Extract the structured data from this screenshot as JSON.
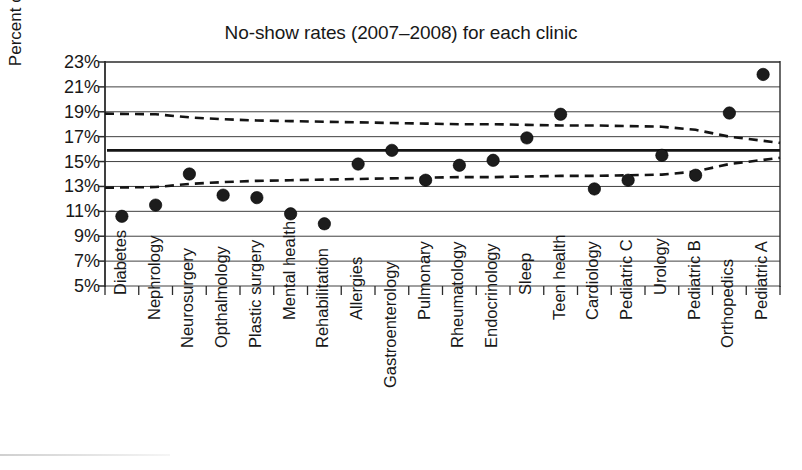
{
  "chart_data": {
    "type": "scatter",
    "title": "No-show rates (2007–2008) for each clinic",
    "xlabel": "",
    "ylabel": "Percent of appointments",
    "ylim": [
      5,
      23
    ],
    "ytick_labels": [
      "23%",
      "21%",
      "19%",
      "17%",
      "15%",
      "13%",
      "11%",
      "9%",
      "7%",
      "5%"
    ],
    "ytick_values": [
      23,
      21,
      19,
      17,
      15,
      13,
      11,
      9,
      7,
      5
    ],
    "grid": true,
    "legend": "none",
    "categories": [
      "Diabetes",
      "Nephrology",
      "Neurosurgery",
      "Opthalmology",
      "Plastic surgery",
      "Mental health",
      "Rehabilitation",
      "Allergies",
      "Gastroenterology",
      "Pulmonary",
      "Rheumatology",
      "Endocrinology",
      "Sleep",
      "Teen health",
      "Cardiology",
      "Pediatric C",
      "Urology",
      "Pediatric B",
      "Orthopedics",
      "Pediatric A"
    ],
    "values": [
      10.6,
      11.5,
      14.0,
      12.3,
      12.1,
      10.8,
      10.0,
      14.8,
      15.9,
      13.5,
      14.7,
      15.1,
      16.9,
      18.8,
      12.8,
      13.5,
      15.5,
      13.9,
      18.9,
      22.0
    ],
    "center_line": {
      "name": "Center line (mean)",
      "value": 15.9,
      "style": "solid"
    },
    "upper_control_limit": {
      "name": "Upper control limit",
      "style": "dashed",
      "values": [
        18.85,
        18.8,
        18.55,
        18.4,
        18.3,
        18.25,
        18.2,
        18.15,
        18.1,
        18.05,
        18.0,
        18.0,
        17.95,
        17.9,
        17.9,
        17.85,
        17.8,
        17.55,
        17.0,
        16.5
      ]
    },
    "lower_control_limit": {
      "name": "Lower control limit",
      "style": "dashed",
      "values": [
        12.9,
        12.95,
        13.2,
        13.35,
        13.45,
        13.5,
        13.55,
        13.6,
        13.65,
        13.7,
        13.75,
        13.75,
        13.8,
        13.85,
        13.85,
        13.9,
        13.95,
        14.2,
        14.8,
        15.3
      ]
    }
  }
}
